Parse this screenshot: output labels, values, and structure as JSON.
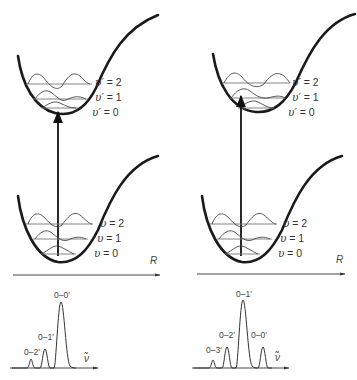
{
  "panels": [
    {
      "id": "left",
      "upper_state": {
        "levels": [
          {
            "var": "υ′",
            "eq": " = ",
            "num": "2"
          },
          {
            "var": "υ′",
            "eq": " = ",
            "num": "1"
          },
          {
            "var": "υ′",
            "eq": " = ",
            "num": "0"
          }
        ]
      },
      "lower_state": {
        "levels": [
          {
            "var": "υ",
            "eq": " = ",
            "num": "2"
          },
          {
            "var": "υ",
            "eq": " = ",
            "num": "1"
          },
          {
            "var": "υ",
            "eq": " = ",
            "num": "0"
          }
        ]
      },
      "axis_label": "R",
      "spectrum": {
        "axis_label": "ν̃",
        "peaks": [
          {
            "label": "0–2′",
            "relative_height": 0.18
          },
          {
            "label": "0–1′",
            "relative_height": 0.45
          },
          {
            "label": "0–0′",
            "relative_height": 1.0
          }
        ]
      }
    },
    {
      "id": "right",
      "upper_state": {
        "levels": [
          {
            "var": "υ′",
            "eq": " = ",
            "num": "2"
          },
          {
            "var": "υ′",
            "eq": " = ",
            "num": "1"
          },
          {
            "var": "υ′",
            "eq": " = ",
            "num": "0"
          }
        ]
      },
      "lower_state": {
        "levels": [
          {
            "var": "υ",
            "eq": " = ",
            "num": "2"
          },
          {
            "var": "υ",
            "eq": " = ",
            "num": "1"
          },
          {
            "var": "υ",
            "eq": " = ",
            "num": "0"
          }
        ]
      },
      "axis_label": "R",
      "spectrum": {
        "axis_label": "ν̃",
        "peaks": [
          {
            "label": "0–3′",
            "relative_height": 0.16
          },
          {
            "label": "0–2′",
            "relative_height": 0.4
          },
          {
            "label": "0–1′",
            "relative_height": 1.0
          },
          {
            "label": "0–0′",
            "relative_height": 0.4
          }
        ]
      }
    }
  ],
  "colors": {
    "curve": "#1a1a1a",
    "level": "#777777",
    "text": "#333333"
  }
}
